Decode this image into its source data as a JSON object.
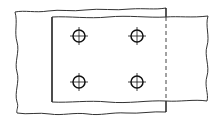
{
  "diagram": {
    "type": "technical-drawing",
    "colors": {
      "background": "#ffffff",
      "line": "#1a1a1a",
      "break_line": "#555555"
    },
    "plates": [
      {
        "name": "lower-plate",
        "visible_edge": "left",
        "break_edges": [
          "top",
          "bottom",
          "left"
        ]
      },
      {
        "name": "upper-plate",
        "visible_edge": "left",
        "hidden_edge": "right",
        "break_edges": [
          "top",
          "bottom",
          "right"
        ]
      }
    ],
    "holes": [
      {
        "row": 1,
        "col": 1,
        "cx": 79,
        "cy": 36
      },
      {
        "row": 1,
        "col": 2,
        "cx": 137,
        "cy": 36
      },
      {
        "row": 2,
        "col": 1,
        "cx": 79,
        "cy": 82
      },
      {
        "row": 2,
        "col": 2,
        "cx": 137,
        "cy": 82
      }
    ],
    "hole_count": 4,
    "hole_radius": 6,
    "centerline_arm": 9
  }
}
